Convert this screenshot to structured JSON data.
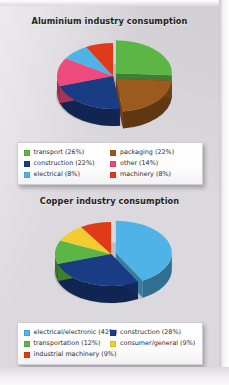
{
  "page": {
    "background_color": "#dcd9de"
  },
  "charts": [
    {
      "id": "aluminium",
      "title": "Aluminium industry consumption",
      "legend": [
        {
          "label": "transport (26%)",
          "color": "#5cb646"
        },
        {
          "label": "packaging (22%)",
          "color": "#9c5a1e"
        },
        {
          "label": "construction (22%)",
          "color": "#1a3c84"
        },
        {
          "label": "other (14%)",
          "color": "#ee4a7b"
        },
        {
          "label": "electrical (8%)",
          "color": "#4fb3e8"
        },
        {
          "label": "machinery (8%)",
          "color": "#e03a18"
        }
      ]
    },
    {
      "id": "copper",
      "title": "Copper industry consumption",
      "legend": [
        {
          "label": "electrical/electronic (42%)",
          "color": "#4fb3e8"
        },
        {
          "label": "construction (28%)",
          "color": "#1a3c84"
        },
        {
          "label": "transportation (12%)",
          "color": "#5cb646"
        },
        {
          "label": "consumer/general (9%)",
          "color": "#f2cc30"
        },
        {
          "label": "industrial machinery (9%)",
          "color": "#e03a18"
        }
      ]
    }
  ],
  "chart_data": [
    {
      "type": "pie",
      "title": "Aluminium industry consumption",
      "style": "3d-exploded",
      "unit": "percent",
      "labels": [
        "transport",
        "packaging",
        "construction",
        "other",
        "electrical",
        "machinery"
      ],
      "values": [
        26,
        22,
        22,
        14,
        8,
        8
      ],
      "colors": [
        "#5cb646",
        "#9c5a1e",
        "#1a3c84",
        "#ee4a7b",
        "#4fb3e8",
        "#e03a18"
      ],
      "legend_position": "bottom",
      "legend_entries": [
        "transport (26%)",
        "packaging (22%)",
        "construction (22%)",
        "other (14%)",
        "electrical (8%)",
        "machinery (8%)"
      ],
      "total": 100
    },
    {
      "type": "pie",
      "title": "Copper industry consumption",
      "style": "3d-exploded",
      "unit": "percent",
      "labels": [
        "electrical/electronic",
        "construction",
        "transportation",
        "consumer/general",
        "industrial machinery"
      ],
      "values": [
        42,
        28,
        12,
        9,
        9
      ],
      "colors": [
        "#4fb3e8",
        "#1a3c84",
        "#5cb646",
        "#f2cc30",
        "#e03a18"
      ],
      "legend_position": "bottom",
      "legend_entries": [
        "electrical/electronic (42%)",
        "construction (28%)",
        "transportation (12%)",
        "consumer/general (9%)",
        "industrial machinery (9%)"
      ],
      "total": 100
    }
  ]
}
